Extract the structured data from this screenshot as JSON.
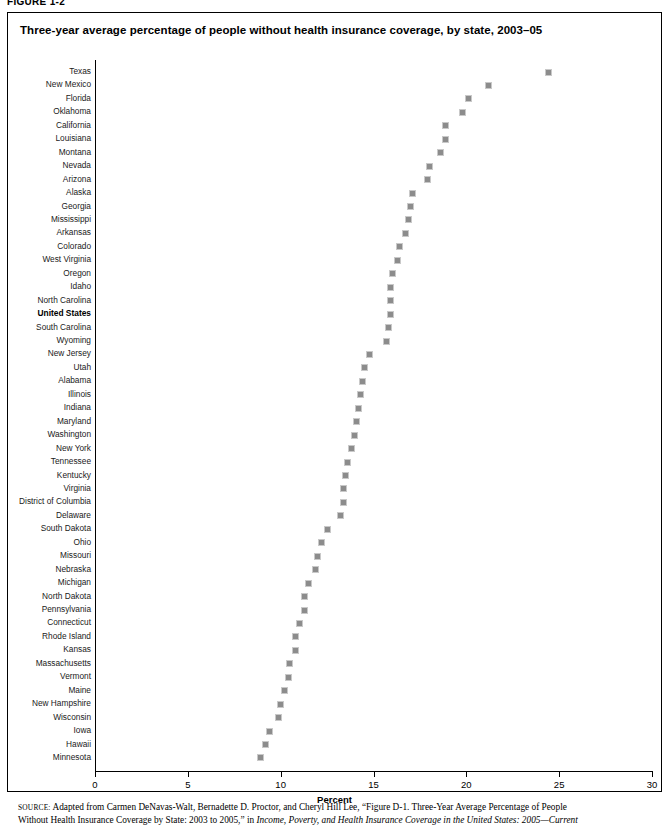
{
  "figure": {
    "number": "FIGURE 1-2",
    "title": "Three-year average percentage of people without health insurance coverage, by state, 2003–05"
  },
  "axis": {
    "x_title": "Percent",
    "x_ticks": [
      "0",
      "5",
      "10",
      "15",
      "20",
      "25",
      "30"
    ],
    "x_min": 0,
    "x_max": 30
  },
  "source": {
    "label": "SOURCE:",
    "line1": "Adapted from Carmen DeNavas-Walt, Bernadette D. Proctor, and Cheryl Hill Lee, “Figure D-1. Three-Year Average Percentage of People",
    "line2_a": "Without Health Insurance Coverage by State: 2003 to 2005,” in ",
    "line2_b": "Income, Poverty, and Health Insurance Coverage in the United States: 2005—Current"
  },
  "colors": {
    "marker_fill": "#7a7a7a",
    "marker_border": "#c9c9c9",
    "axis": "#000000",
    "background": "#ffffff"
  },
  "chart_data": {
    "type": "scatter",
    "title": "Three-year average percentage of people without health insurance coverage, by state, 2003–05",
    "xlabel": "Percent",
    "ylabel": "",
    "xlim": [
      0,
      30
    ],
    "grid": false,
    "legend": "none",
    "orientation": "horizontal-dot",
    "highlight_category": "United States",
    "categories": [
      "Texas",
      "New Mexico",
      "Florida",
      "Oklahoma",
      "California",
      "Louisiana",
      "Montana",
      "Nevada",
      "Arizona",
      "Alaska",
      "Georgia",
      "Mississippi",
      "Arkansas",
      "Colorado",
      "West Virginia",
      "Oregon",
      "Idaho",
      "North Carolina",
      "United States",
      "South Carolina",
      "Wyoming",
      "New Jersey",
      "Utah",
      "Alabama",
      "Illinois",
      "Indiana",
      "Maryland",
      "Washington",
      "New York",
      "Tennessee",
      "Kentucky",
      "Virginia",
      "District of Columbia",
      "Delaware",
      "South Dakota",
      "Ohio",
      "Missouri",
      "Nebraska",
      "Michigan",
      "North Dakota",
      "Pennsylvania",
      "Connecticut",
      "Rhode Island",
      "Kansas",
      "Massachusetts",
      "Vermont",
      "Maine",
      "New Hampshire",
      "Wisconsin",
      "Iowa",
      "Hawaii",
      "Minnesota"
    ],
    "values": [
      24.4,
      21.2,
      20.1,
      19.8,
      18.9,
      18.9,
      18.6,
      18.0,
      17.9,
      17.1,
      17.0,
      16.9,
      16.7,
      16.4,
      16.3,
      16.0,
      15.9,
      15.9,
      15.9,
      15.8,
      15.7,
      14.8,
      14.5,
      14.4,
      14.3,
      14.2,
      14.1,
      14.0,
      13.8,
      13.6,
      13.5,
      13.4,
      13.4,
      13.2,
      12.5,
      12.2,
      12.0,
      11.9,
      11.5,
      11.3,
      11.3,
      11.0,
      10.8,
      10.8,
      10.5,
      10.4,
      10.2,
      10.0,
      9.9,
      9.4,
      9.2,
      8.9
    ],
    "units": "percent"
  }
}
